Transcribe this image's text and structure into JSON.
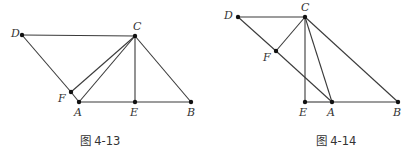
{
  "figures": [
    {
      "id": "fig-4-13",
      "caption": "图 4-13",
      "points": {
        "D": {
          "label": "D"
        },
        "C": {
          "label": "C"
        },
        "F": {
          "label": "F"
        },
        "A": {
          "label": "A"
        },
        "E": {
          "label": "E"
        },
        "B": {
          "label": "B"
        }
      },
      "segments": [
        [
          "D",
          "C"
        ],
        [
          "D",
          "F"
        ],
        [
          "F",
          "A"
        ],
        [
          "C",
          "F"
        ],
        [
          "C",
          "A"
        ],
        [
          "C",
          "E"
        ],
        [
          "C",
          "B"
        ],
        [
          "A",
          "E"
        ],
        [
          "E",
          "B"
        ]
      ]
    },
    {
      "id": "fig-4-14",
      "caption": "图 4-14",
      "points": {
        "D": {
          "label": "D"
        },
        "C": {
          "label": "C"
        },
        "F": {
          "label": "F"
        },
        "E": {
          "label": "E"
        },
        "A": {
          "label": "A"
        },
        "B": {
          "label": "B"
        }
      },
      "segments": [
        [
          "D",
          "C"
        ],
        [
          "D",
          "F"
        ],
        [
          "F",
          "A"
        ],
        [
          "C",
          "F"
        ],
        [
          "C",
          "E"
        ],
        [
          "C",
          "A"
        ],
        [
          "C",
          "B"
        ],
        [
          "E",
          "A"
        ],
        [
          "A",
          "B"
        ]
      ]
    }
  ]
}
